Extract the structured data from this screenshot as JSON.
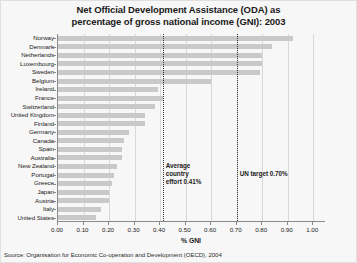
{
  "chart_data": {
    "type": "bar",
    "orientation": "horizontal",
    "title": "Net Official Development Assistance (ODA) as percentage of gross national income (GNI): 2003",
    "title_line1": "Net Official Development Assistance (ODA) as",
    "title_line2": "percentage of gross national income (GNI): 2003",
    "xlabel": "% GNI",
    "ylabel": "",
    "xlim": [
      0.0,
      1.05
    ],
    "xticks": [
      0.0,
      0.1,
      0.2,
      0.3,
      0.4,
      0.5,
      0.6,
      0.7,
      0.8,
      0.9,
      1.0
    ],
    "xtick_labels": [
      "0.00",
      "0.10",
      "0.20",
      "0.30",
      "0.40",
      "0.50",
      "0.60",
      "0.70",
      "0.80",
      "0.90",
      "1.00"
    ],
    "grid": true,
    "legend": "none",
    "bar_color": "#c9c9c9",
    "categories": [
      "Norway",
      "Denmark",
      "Netherlands",
      "Luxembourg",
      "Sweden",
      "Belgium",
      "Ireland",
      "France",
      "Switzerland",
      "United Kingdom",
      "Finland",
      "Germany",
      "Canada",
      "Spain",
      "Australia",
      "New Zealand",
      "Portugal",
      "Greece",
      "Japan",
      "Austria",
      "Italy",
      "United States"
    ],
    "values": [
      0.92,
      0.84,
      0.8,
      0.8,
      0.79,
      0.6,
      0.39,
      0.41,
      0.38,
      0.34,
      0.34,
      0.28,
      0.26,
      0.25,
      0.25,
      0.23,
      0.22,
      0.21,
      0.2,
      0.2,
      0.17,
      0.15
    ],
    "annotations": [
      {
        "name": "average-country-effort",
        "value": 0.41,
        "text_line1": "Average",
        "text_line2": "country",
        "text_line3": "effort 0.41%"
      },
      {
        "name": "un-target",
        "value": 0.7,
        "text_line1": "UN target 0.70%"
      }
    ],
    "source": "Source: Organisation for Economic Co-operation and Development (OECD), 2004"
  }
}
